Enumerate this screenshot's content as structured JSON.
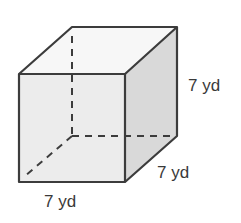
{
  "figure": {
    "type": "cube",
    "colors": {
      "front_face": "#ececec",
      "top_face": "#f7f7f7",
      "side_face": "#d9d9d9",
      "edge": "#3c3c3c"
    },
    "labels": {
      "height": "7 yd",
      "depth": "7 yd",
      "width": "7 yd"
    }
  }
}
